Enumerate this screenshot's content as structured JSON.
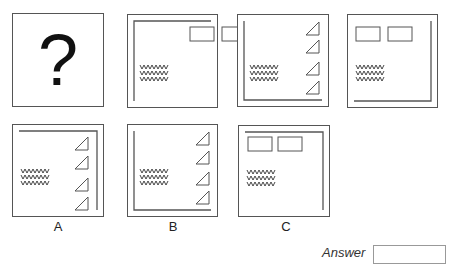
{
  "puzzle": {
    "stroke_color": "#555555",
    "sequence": [
      {
        "id": "q",
        "type": "question",
        "glyph": "?",
        "x": 12,
        "y": 13,
        "w": 92,
        "h": 94
      },
      {
        "id": "s2",
        "type": "frame",
        "x": 127,
        "y": 14,
        "w": 91,
        "h": 94,
        "inner_l": "top-left",
        "rects": [
          [
            62,
            12,
            24,
            14
          ],
          [
            94,
            12,
            24,
            14
          ]
        ],
        "zigzag": [
          12,
          50
        ],
        "triangles": []
      },
      {
        "id": "s3",
        "type": "frame",
        "x": 237,
        "y": 14,
        "w": 92,
        "h": 93,
        "inner_l": "bottom-left",
        "rects": [],
        "zigzag": [
          12,
          50
        ],
        "triangles": [
          [
            68,
            7
          ],
          [
            68,
            25
          ],
          [
            68,
            47
          ],
          [
            68,
            66
          ]
        ]
      },
      {
        "id": "s4",
        "type": "frame",
        "x": 347,
        "y": 14,
        "w": 91,
        "h": 94,
        "inner_l": "bottom-right",
        "rects": [
          [
            8,
            12,
            24,
            14
          ],
          [
            40,
            12,
            24,
            14
          ]
        ],
        "zigzag": [
          8,
          50
        ],
        "triangles": []
      }
    ],
    "options": [
      {
        "id": "A",
        "label": "A",
        "label_x": 48,
        "type": "frame",
        "x": 12,
        "y": 124,
        "w": 92,
        "h": 93,
        "inner_l": "top-right",
        "rects": [],
        "zigzag": [
          8,
          44
        ],
        "triangles": [
          [
            62,
            12
          ],
          [
            62,
            31
          ],
          [
            62,
            53
          ],
          [
            62,
            72
          ]
        ]
      },
      {
        "id": "B",
        "label": "B",
        "label_x": 163,
        "type": "frame",
        "x": 127,
        "y": 124,
        "w": 91,
        "h": 93,
        "inner_l": "bottom-left",
        "rects": [],
        "zigzag": [
          12,
          44
        ],
        "triangles": [
          [
            68,
            7
          ],
          [
            68,
            26
          ],
          [
            68,
            47
          ],
          [
            68,
            66
          ]
        ]
      },
      {
        "id": "C",
        "label": "C",
        "label_x": 276,
        "type": "frame",
        "x": 238,
        "y": 125,
        "w": 92,
        "h": 92,
        "inner_l": "top-right",
        "rects": [
          [
            9,
            11,
            24,
            14
          ],
          [
            39,
            11,
            24,
            14
          ]
        ],
        "zigzag": [
          8,
          44
        ],
        "triangles": []
      }
    ],
    "option_label_y": 219
  },
  "answer": {
    "label": "Answer",
    "value": ""
  }
}
